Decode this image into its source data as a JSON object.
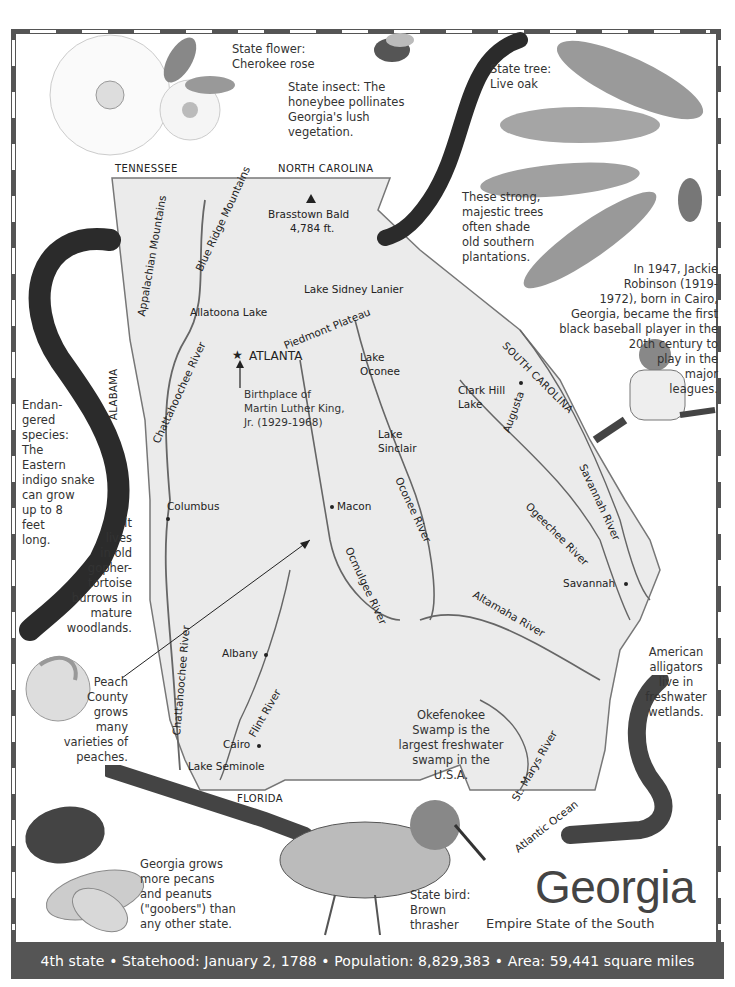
{
  "title": "Georgia",
  "subtitle": "Empire State of the South",
  "footer": {
    "text": "4th state • Statehood: January 2, 1788 • Population: 8,829,383 • Area: 59,441 square miles",
    "items": [
      "4th state",
      "Statehood: January 2, 1788",
      "Population: 8,829,383",
      "Area: 59,441 square miles"
    ]
  },
  "notes": {
    "state_flower": "State flower:\n     Cherokee rose",
    "state_insect": "State insect: The\nhoneybee pollinates\nGeorgia's lush\nvegetation.",
    "state_tree": "State tree:\nLive oak",
    "live_oak": "These strong,\nmajestic trees\noften shade\nold southern\nplantations.",
    "jackie_robinson": "In 1947, Jackie\nRobinson (1919-\n1972), born in Cairo,\nGeorgia, became the first\nblack baseball player in the\n20th century to\nplay in the\nmajor\nleagues.",
    "snake": "Endan-\ngered\nspecies:\nThe\nEastern\nindigo snake\ncan grow\nup to 8\nfeet\nlong.",
    "snake_habitat": "It\nlives\nin old\ngopher-\ntortoise\nburrows in\nmature\nwoodlands.",
    "peach": "Peach\nCounty\ngrows\nmany\nvarieties of\npeaches.",
    "okefenokee": "Okefenokee\nSwamp is the\nlargest freshwater\nswamp in the\nU.S.A.",
    "alligator": "American\nalligators\nlive in\nfreshwater\nwetlands.",
    "pecans": "Georgia grows\nmore pecans\nand peanuts\n(\"goobers\") than\nany other state.",
    "state_bird": "State bird:\nBrown\nthrasher",
    "mlk": "Birthplace of\nMartin Luther King,\nJr. (1929-1968)"
  },
  "map": {
    "neighbors": [
      "TENNESSEE",
      "NORTH CAROLINA",
      "SOUTH CAROLINA",
      "ALABAMA",
      "FLORIDA"
    ],
    "capital": "ATLANTA",
    "peak": {
      "name": "Brasstown Bald",
      "elevation": "4,784 ft."
    },
    "cities": [
      "Columbus",
      "Macon",
      "Augusta",
      "Savannah",
      "Albany",
      "Cairo"
    ],
    "rivers": [
      "Chattahoochee River",
      "Chattahoochee River",
      "Ocmulgee River",
      "Oconee River",
      "Ogeechee River",
      "Savannah River",
      "Altamaha River",
      "Flint River",
      "St. Marys River"
    ],
    "lakes": [
      "Allatoona Lake",
      "Lake Sidney Lanier",
      "Lake Oconee",
      "Lake Sinclair",
      "Clark Hill Lake",
      "Lake Seminole"
    ],
    "regions": [
      "Appalachian Mountains",
      "Blue Ridge Mountains",
      "Piedmont Plateau"
    ],
    "water": "Atlantic Ocean"
  },
  "colors": {
    "border": "#555555",
    "footer_bg": "#555555",
    "footer_text": "#ffffff",
    "map_fill": "#ececec"
  }
}
